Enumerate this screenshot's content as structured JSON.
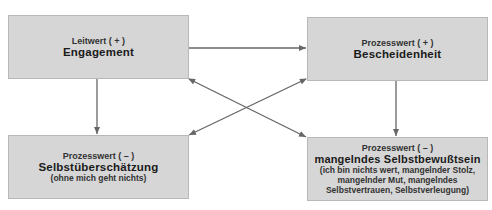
{
  "diagram": {
    "boxes": [
      {
        "id": "b1",
        "sub": "Leitwert ( + )",
        "main": "Engagement",
        "note": ""
      },
      {
        "id": "b2",
        "sub": "Prozesswert ( + )",
        "main": "Bescheidenheit",
        "note": ""
      },
      {
        "id": "b3",
        "sub": "Prozesswert ( – )",
        "main": "Selbstüberschätzung",
        "note": "(ohne mich geht nichts)"
      },
      {
        "id": "b4",
        "sub": "Prozesswert ( – )",
        "main": "mangelndes Selbstbewußtsein",
        "note": "(ich bin nichts wert, mangelnder Stolz, mangelnder Mut, mangelndes Selbstvertrauen, Selbstverleugung)"
      }
    ],
    "edges": [
      {
        "from": "Engagement",
        "to": "Bescheidenheit",
        "type": "arrow"
      },
      {
        "from": "Engagement",
        "to": "Selbstüberschätzung",
        "type": "arrow"
      },
      {
        "from": "Bescheidenheit",
        "to": "mangelndes Selbstbewußtsein",
        "type": "arrow"
      },
      {
        "from": "Engagement",
        "to": "mangelndes Selbstbewußtsein",
        "type": "double-arrow"
      },
      {
        "from": "Bescheidenheit",
        "to": "Selbstüberschätzung",
        "type": "double-arrow"
      }
    ],
    "colors": {
      "box_fill": "#d6d6d6",
      "arrow": "#666666"
    }
  }
}
